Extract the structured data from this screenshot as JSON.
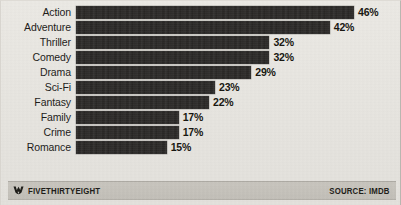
{
  "chart_data": {
    "type": "bar",
    "orientation": "horizontal",
    "title": "",
    "subtitle": "",
    "xlabel": "",
    "ylabel": "",
    "xlim": [
      0,
      46
    ],
    "grid": false,
    "legend": null,
    "value_suffix": "%",
    "categories": [
      "Action",
      "Adventure",
      "Thriller",
      "Comedy",
      "Drama",
      "Sci-Fi",
      "Fantasy",
      "Family",
      "Crime",
      "Romance"
    ],
    "values": [
      46,
      42,
      32,
      32,
      29,
      23,
      22,
      17,
      17,
      15
    ],
    "value_labels": [
      "46%",
      "42%",
      "32%",
      "32%",
      "29%",
      "23%",
      "22%",
      "17%",
      "17%",
      "15%"
    ],
    "bars": [
      {
        "label": "Action",
        "value": 46,
        "value_label": "46%"
      },
      {
        "label": "Adventure",
        "value": 42,
        "value_label": "42%"
      },
      {
        "label": "Thriller",
        "value": 32,
        "value_label": "32%"
      },
      {
        "label": "Comedy",
        "value": 32,
        "value_label": "32%"
      },
      {
        "label": "Drama",
        "value": 29,
        "value_label": "29%"
      },
      {
        "label": "Sci-Fi",
        "value": 23,
        "value_label": "23%"
      },
      {
        "label": "Fantasy",
        "value": 22,
        "value_label": "22%"
      },
      {
        "label": "Family",
        "value": 17,
        "value_label": "17%"
      },
      {
        "label": "Crime",
        "value": 17,
        "value_label": "17%"
      },
      {
        "label": "Romance",
        "value": 15,
        "value_label": "15%"
      }
    ]
  },
  "footer": {
    "brand_icon": "fivethirtyeight-logo-icon",
    "brand": "FIVETHIRTYEIGHT",
    "source": "SOURCE: IMDB"
  },
  "colors": {
    "bar": "#242220",
    "background": "#e9e7e2",
    "footer_band": "#c7c4bd",
    "text": "#1c1b19"
  }
}
